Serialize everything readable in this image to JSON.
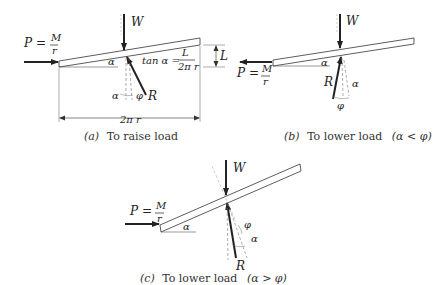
{
  "figure": {
    "panels": [
      {
        "id": "a",
        "caption_letter": "(a)",
        "caption_text": "To raise load",
        "force_P": "P =",
        "frac_num": "M",
        "frac_den": "r",
        "W": "W",
        "R": "R",
        "alpha": "α",
        "phi": "φ",
        "tan_lhs": "tan α =",
        "tan_num": "L",
        "tan_den": "2π r",
        "lead": "L",
        "base": "2π r"
      },
      {
        "id": "b",
        "caption_letter": "(b)",
        "caption_text": "To lower load",
        "caption_cond": "(α < φ)",
        "force_P": "P =",
        "frac_num": "M",
        "frac_den": "r",
        "W": "W",
        "R": "R",
        "alpha": "α",
        "phi": "φ"
      },
      {
        "id": "c",
        "caption_letter": "(c)",
        "caption_text": "To lower load",
        "caption_cond": "(α > φ)",
        "force_P": "P =",
        "frac_num": "M",
        "frac_den": "r",
        "W": "W",
        "R": "R",
        "alpha": "α",
        "phi": "φ"
      }
    ]
  }
}
